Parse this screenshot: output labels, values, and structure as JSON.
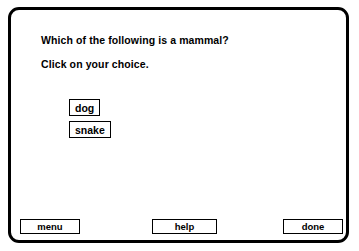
{
  "panel": {
    "question": "Which of the following is a mammal?",
    "prompt": "Click on your choice."
  },
  "choices": [
    {
      "label": "dog"
    },
    {
      "label": "snake"
    }
  ],
  "buttons": {
    "menu_label": "menu",
    "help_label": "help",
    "done_label": "done"
  },
  "colors": {
    "frame": "#000000",
    "background": "#ffffff",
    "text": "#000000"
  }
}
